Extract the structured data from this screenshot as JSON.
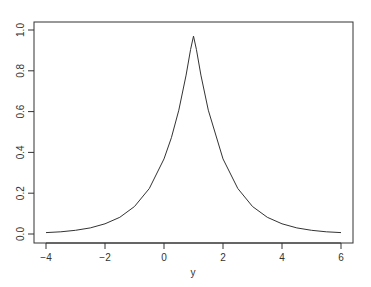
{
  "chart_data": {
    "type": "line",
    "title": "",
    "xlabel": "y",
    "ylabel": "",
    "xlim": [
      -4.2,
      6.4
    ],
    "ylim": [
      -0.04,
      1.04
    ],
    "grid": false,
    "legend": null,
    "x_ticks": [
      -4,
      -2,
      0,
      2,
      4,
      6
    ],
    "x_tick_labels": [
      "−4",
      "−2",
      "0",
      "2",
      "4",
      "6"
    ],
    "y_ticks": [
      0.0,
      0.2,
      0.4,
      0.6,
      0.8,
      1.0
    ],
    "y_tick_labels": [
      "0.0",
      "0.2",
      "0.4",
      "0.6",
      "0.8",
      "1.0"
    ],
    "series": [
      {
        "name": "density",
        "description": "Sharp peaked symmetric curve centered at y=1, approx exp(-|y-1|)",
        "x": [
          -4,
          -3.5,
          -3,
          -2.5,
          -2,
          -1.5,
          -1,
          -0.5,
          0,
          0.25,
          0.5,
          0.75,
          0.9,
          1,
          1.1,
          1.25,
          1.5,
          2,
          2.5,
          3,
          3.5,
          4,
          4.5,
          5,
          5.5,
          6
        ],
        "y": [
          0.007,
          0.011,
          0.018,
          0.03,
          0.05,
          0.082,
          0.135,
          0.223,
          0.368,
          0.472,
          0.607,
          0.779,
          0.905,
          0.97,
          0.905,
          0.779,
          0.607,
          0.368,
          0.223,
          0.135,
          0.082,
          0.05,
          0.03,
          0.018,
          0.011,
          0.007
        ]
      }
    ]
  },
  "colors": {
    "line": "#333333",
    "axis": "#333333",
    "background": "#ffffff"
  }
}
